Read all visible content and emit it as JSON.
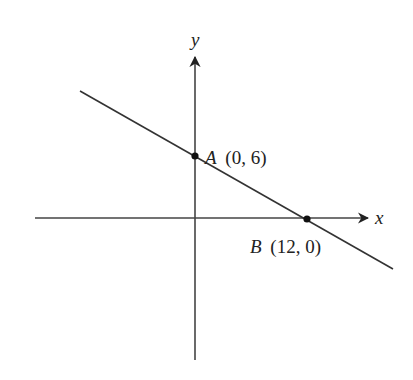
{
  "diagram": {
    "type": "coordinate-plane-line",
    "axes": {
      "x_label": "x",
      "y_label": "y"
    },
    "points": [
      {
        "name": "A",
        "coords": "(0, 6)",
        "x": 0,
        "y": 6
      },
      {
        "name": "B",
        "coords": "(12, 0)",
        "x": 12,
        "y": 0
      }
    ],
    "line": {
      "passes_through": [
        "A",
        "B"
      ]
    },
    "colors": {
      "ink": "#222222",
      "background": "#ffffff"
    }
  }
}
